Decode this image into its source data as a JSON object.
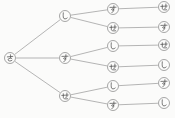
{
  "diagram": {
    "type": "tree",
    "orientation": "left-to-right",
    "levels": 4,
    "node_radius": 5.5,
    "colors": {
      "background": "#fbfbfa",
      "edge": "#a2a2a2",
      "node_stroke": "#8f8f8f",
      "node_fill": "#fcfcfb",
      "label": "#4f4f4f"
    },
    "nodes": [
      {
        "id": "root",
        "label": "さ",
        "x": 10,
        "y": 58
      },
      {
        "id": "b1",
        "label": "し",
        "x": 65,
        "y": 16
      },
      {
        "id": "b2",
        "label": "す",
        "x": 65,
        "y": 58
      },
      {
        "id": "b3",
        "label": "せ",
        "x": 65,
        "y": 96
      },
      {
        "id": "c1",
        "label": "す",
        "x": 113,
        "y": 9
      },
      {
        "id": "c2",
        "label": "せ",
        "x": 113,
        "y": 28
      },
      {
        "id": "c3",
        "label": "し",
        "x": 113,
        "y": 46
      },
      {
        "id": "c4",
        "label": "せ",
        "x": 113,
        "y": 67
      },
      {
        "id": "c5",
        "label": "し",
        "x": 113,
        "y": 86
      },
      {
        "id": "c6",
        "label": "す",
        "x": 113,
        "y": 105
      },
      {
        "id": "d1",
        "label": "せ",
        "x": 164,
        "y": 7
      },
      {
        "id": "d2",
        "label": "す",
        "x": 164,
        "y": 27
      },
      {
        "id": "d3",
        "label": "せ",
        "x": 164,
        "y": 45
      },
      {
        "id": "d4",
        "label": "し",
        "x": 164,
        "y": 65
      },
      {
        "id": "d5",
        "label": "す",
        "x": 164,
        "y": 83
      },
      {
        "id": "d6",
        "label": "し",
        "x": 164,
        "y": 103
      }
    ],
    "edges": [
      [
        "root",
        "b1"
      ],
      [
        "root",
        "b2"
      ],
      [
        "root",
        "b3"
      ],
      [
        "b1",
        "c1"
      ],
      [
        "b1",
        "c2"
      ],
      [
        "b2",
        "c3"
      ],
      [
        "b2",
        "c4"
      ],
      [
        "b3",
        "c5"
      ],
      [
        "b3",
        "c6"
      ],
      [
        "c1",
        "d1"
      ],
      [
        "c2",
        "d2"
      ],
      [
        "c3",
        "d3"
      ],
      [
        "c4",
        "d4"
      ],
      [
        "c5",
        "d5"
      ],
      [
        "c6",
        "d6"
      ]
    ]
  }
}
